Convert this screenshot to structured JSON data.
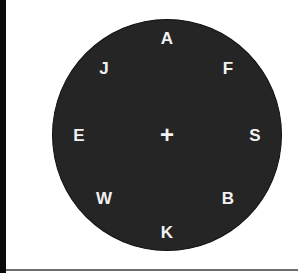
{
  "circle": {
    "fill_color": "#252525",
    "letters": [
      {
        "label": "A",
        "x": 167,
        "y": 38
      },
      {
        "label": "F",
        "x": 228,
        "y": 68
      },
      {
        "label": "S",
        "x": 255,
        "y": 135
      },
      {
        "label": "B",
        "x": 228,
        "y": 198
      },
      {
        "label": "K",
        "x": 167,
        "y": 232
      },
      {
        "label": "W",
        "x": 104,
        "y": 198
      },
      {
        "label": "E",
        "x": 79,
        "y": 135
      },
      {
        "label": "J",
        "x": 104,
        "y": 68
      }
    ],
    "center_symbol": "+"
  }
}
